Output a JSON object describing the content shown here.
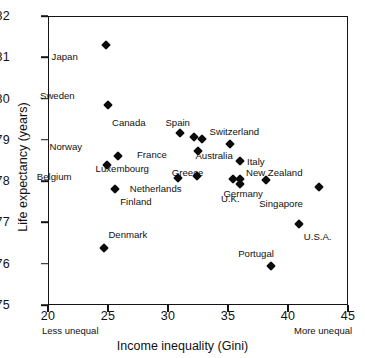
{
  "chart_data": {
    "type": "scatter",
    "title": "",
    "xlabel": "Income inequality (Gini)",
    "ylabel": "Life expectancy (years)",
    "xlim": [
      20,
      45
    ],
    "ylim": [
      75,
      82
    ],
    "xticks": [
      20,
      25,
      30,
      35,
      40,
      45
    ],
    "yticks": [
      75,
      76,
      77,
      78,
      79,
      80,
      81,
      82
    ],
    "grid": false,
    "legend": "none",
    "annotations": {
      "x_axis_left_note": "Less unequal",
      "x_axis_right_note": "More unequal"
    },
    "points": [
      {
        "label": "Japan",
        "x": 24.8,
        "y": 81.3,
        "label_dx": -34,
        "label_dy": 11
      },
      {
        "label": "Sweden",
        "x": 25.0,
        "y": 79.85,
        "label_dx": -39,
        "label_dy": -10
      },
      {
        "label": "Canada",
        "x": 31.0,
        "y": 79.17,
        "label_dx": -40,
        "label_dy": -11
      },
      {
        "label": "Spain",
        "x": 32.2,
        "y": 79.07,
        "label_dx": -10,
        "label_dy": -15
      },
      {
        "label": "Switzerland",
        "x": 32.8,
        "y": 79.02,
        "label_dx": 8,
        "label_dy": -8
      },
      {
        "label": "Australia",
        "x": 35.2,
        "y": 78.9,
        "label_dx": -4,
        "label_dy": 11
      },
      {
        "label": "Norway",
        "x": 25.8,
        "y": 78.6,
        "label_dx": -41,
        "label_dy": -10
      },
      {
        "label": "France",
        "x": 32.5,
        "y": 78.72,
        "label_dx": -37,
        "label_dy": 3
      },
      {
        "label": "Italy",
        "x": 36.0,
        "y": 78.5,
        "label_dx": 7,
        "label_dy": 0
      },
      {
        "label": "Belgium",
        "x": 24.9,
        "y": 78.4,
        "label_dx": -41,
        "label_dy": 11
      },
      {
        "label": "Greece",
        "x": 35.4,
        "y": 78.05,
        "label_dx": -36,
        "label_dy": -7
      },
      {
        "label": "New Zealand",
        "x": 36.0,
        "y": 78.05,
        "label_dx": 6,
        "label_dy": -7
      },
      {
        "label": "Luxembourg",
        "x": 30.8,
        "y": 78.08,
        "label_dx": -35,
        "label_dy": -10
      },
      {
        "label": "Netherlands",
        "x": 32.4,
        "y": 78.12,
        "label_dx": -21,
        "label_dy": 12
      },
      {
        "label": "U.K.",
        "x": 36.0,
        "y": 77.93,
        "label_dx": -6,
        "label_dy": 14
      },
      {
        "label": "Germany",
        "x": 38.2,
        "y": 78.02,
        "label_dx": -10,
        "label_dy": 13
      },
      {
        "label": "Finland",
        "x": 25.6,
        "y": 77.8,
        "label_dx": 5,
        "label_dy": 12
      },
      {
        "label": "Singapore",
        "x": 42.6,
        "y": 77.86,
        "label_dx": -22,
        "label_dy": 16
      },
      {
        "label": "U.S.A.",
        "x": 40.9,
        "y": 76.95,
        "label_dx": 5,
        "label_dy": 12
      },
      {
        "label": "Denmark",
        "x": 24.7,
        "y": 76.38,
        "label_dx": 4,
        "label_dy": -14
      },
      {
        "label": "Portugal",
        "x": 38.6,
        "y": 75.95,
        "label_dx": -3,
        "label_dy": -13
      }
    ]
  }
}
